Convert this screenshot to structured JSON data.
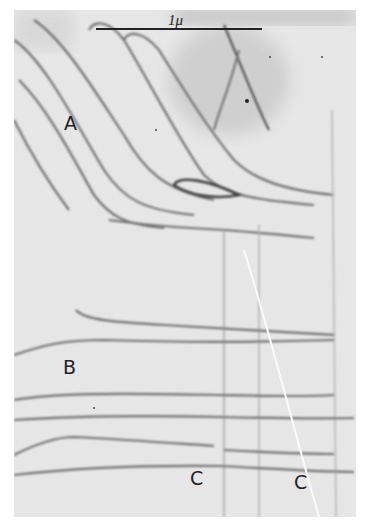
{
  "figure": {
    "type": "electron micrograph",
    "scale_bar": {
      "label": "1μ"
    },
    "labels": [
      {
        "id": "A",
        "text": "A"
      },
      {
        "id": "B",
        "text": "B"
      },
      {
        "id": "C1",
        "text": "C"
      },
      {
        "id": "C2",
        "text": "C"
      }
    ],
    "colors": {
      "background": "#e6e6e6",
      "lines": "#6a6a6a",
      "dark_region": "#bdbdbd"
    }
  }
}
